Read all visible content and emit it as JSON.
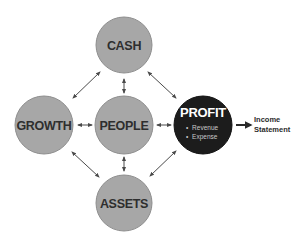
{
  "diagram": {
    "colors": {
      "node_fill": "#a7a7a7",
      "node_stroke": "#8e8e8e",
      "profit_fill": "#1c1c1c",
      "arrow": "#4a4a4a",
      "label": "#2e2e2e"
    },
    "nodes": {
      "cash": {
        "label": "CASH"
      },
      "growth": {
        "label": "GROWTH"
      },
      "people": {
        "label": "PEOPLE"
      },
      "assets": {
        "label": "ASSETS"
      },
      "profit": {
        "label": "PROFIT",
        "bullets": [
          "Revenue",
          "Expense"
        ],
        "bullet_symbol": "•"
      }
    },
    "output": {
      "line1": "Income",
      "line2": "Statement"
    },
    "connections": [
      {
        "from": "cash",
        "to": "growth",
        "type": "bidirectional"
      },
      {
        "from": "cash",
        "to": "people",
        "type": "bidirectional"
      },
      {
        "from": "cash",
        "to": "profit",
        "type": "bidirectional"
      },
      {
        "from": "growth",
        "to": "people",
        "type": "bidirectional"
      },
      {
        "from": "people",
        "to": "profit",
        "type": "bidirectional"
      },
      {
        "from": "growth",
        "to": "assets",
        "type": "bidirectional"
      },
      {
        "from": "people",
        "to": "assets",
        "type": "bidirectional"
      },
      {
        "from": "profit",
        "to": "assets",
        "type": "bidirectional"
      },
      {
        "from": "profit",
        "to": "income_statement",
        "type": "directional"
      }
    ]
  }
}
